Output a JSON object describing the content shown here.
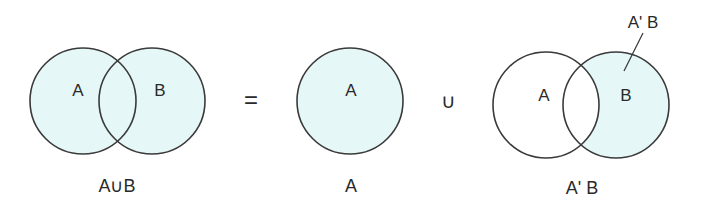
{
  "colors": {
    "fill": "#e6f7f7",
    "stroke": "#3a3a3a",
    "background": "#ffffff"
  },
  "diagram_union": {
    "circle_a_label": "A",
    "circle_b_label": "B",
    "caption": "A∪B"
  },
  "operator_equals": "=",
  "diagram_a": {
    "circle_label": "A",
    "caption": "A"
  },
  "operator_union": "∪",
  "diagram_difference": {
    "circle_a_label": "A",
    "circle_b_label": "B",
    "callout_label": "A' B",
    "caption": "A' B"
  }
}
